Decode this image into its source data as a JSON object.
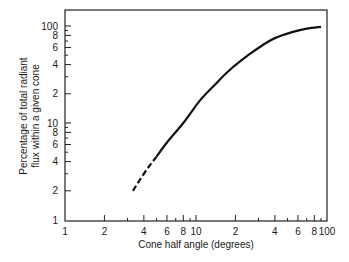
{
  "chart_data": {
    "type": "line",
    "title": "",
    "xlabel": "Cone half angle (degrees)",
    "ylabel_lines": [
      "Percentage of total radiant",
      "flux within a given cone"
    ],
    "ylabel": "Percentage of total radiant flux within a given cone",
    "xscale": "log",
    "yscale": "log",
    "xlim": [
      1,
      100
    ],
    "ylim": [
      1,
      100
    ],
    "grid": false,
    "legend": null,
    "x_ticks": [
      {
        "value": 1,
        "label": "1",
        "major": true
      },
      {
        "value": 2,
        "label": "2",
        "major": true
      },
      {
        "value": 3,
        "label": "",
        "major": false
      },
      {
        "value": 4,
        "label": "4",
        "major": true
      },
      {
        "value": 5,
        "label": "",
        "major": false
      },
      {
        "value": 6,
        "label": "6",
        "major": true
      },
      {
        "value": 7,
        "label": "",
        "major": false
      },
      {
        "value": 8,
        "label": "8",
        "major": true
      },
      {
        "value": 9,
        "label": "",
        "major": false
      },
      {
        "value": 10,
        "label": "10",
        "major": true
      },
      {
        "value": 20,
        "label": "2",
        "major": true
      },
      {
        "value": 30,
        "label": "",
        "major": false
      },
      {
        "value": 40,
        "label": "4",
        "major": true
      },
      {
        "value": 50,
        "label": "",
        "major": false
      },
      {
        "value": 60,
        "label": "6",
        "major": true
      },
      {
        "value": 70,
        "label": "",
        "major": false
      },
      {
        "value": 80,
        "label": "8",
        "major": true
      },
      {
        "value": 90,
        "label": "",
        "major": false
      },
      {
        "value": 100,
        "label": "100",
        "major": true
      }
    ],
    "y_ticks": [
      {
        "value": 1,
        "label": "1",
        "major": true
      },
      {
        "value": 2,
        "label": "2",
        "major": true
      },
      {
        "value": 3,
        "label": "",
        "major": false
      },
      {
        "value": 4,
        "label": "4",
        "major": true
      },
      {
        "value": 5,
        "label": "",
        "major": false
      },
      {
        "value": 6,
        "label": "6",
        "major": true
      },
      {
        "value": 7,
        "label": "",
        "major": false
      },
      {
        "value": 8,
        "label": "8",
        "major": true
      },
      {
        "value": 9,
        "label": "",
        "major": false
      },
      {
        "value": 10,
        "label": "10",
        "major": true
      },
      {
        "value": 20,
        "label": "2",
        "major": true
      },
      {
        "value": 30,
        "label": "",
        "major": false
      },
      {
        "value": 40,
        "label": "4",
        "major": true
      },
      {
        "value": 50,
        "label": "",
        "major": false
      },
      {
        "value": 60,
        "label": "6",
        "major": true
      },
      {
        "value": 70,
        "label": "",
        "major": false
      },
      {
        "value": 80,
        "label": "8",
        "major": true
      },
      {
        "value": 90,
        "label": "",
        "major": false
      },
      {
        "value": 100,
        "label": "100",
        "major": true
      }
    ],
    "series": [
      {
        "name": "Radiant flux within cone (extrapolated)",
        "style": "dashed",
        "x": [
          3.3,
          3.8,
          4.4,
          5.0
        ],
        "y": [
          2.0,
          2.7,
          3.6,
          4.5
        ]
      },
      {
        "name": "Radiant flux within cone",
        "style": "solid",
        "x": [
          5.0,
          6.0,
          8.0,
          10.7,
          14.0,
          18.0,
          25.0,
          32.0,
          40.0,
          55.0,
          70.0,
          90.0
        ],
        "y": [
          4.5,
          6.3,
          10.0,
          17.0,
          25.0,
          35.0,
          50.0,
          63.0,
          75.0,
          87.0,
          94.0,
          98.0
        ]
      }
    ],
    "colors": {
      "line": "#111111",
      "axis": "#222222",
      "background": "#ffffff"
    }
  }
}
